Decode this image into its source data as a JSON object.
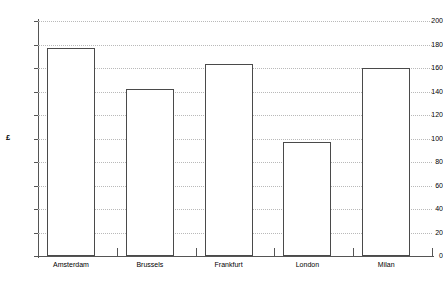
{
  "chart_data": {
    "type": "bar",
    "title": "",
    "xlabel": "",
    "ylabel": "£",
    "categories": [
      "Amsterdam",
      "Brussels",
      "Frankfurt",
      "London",
      "Milan"
    ],
    "values": [
      177,
      142,
      163,
      97,
      160
    ],
    "ylim": [
      0,
      200
    ],
    "ytick_labels": [
      "200",
      "180",
      "160",
      "140",
      "120",
      "100",
      "80",
      "60",
      "40",
      "20",
      "0"
    ],
    "ytick_values": [
      200,
      180,
      160,
      140,
      120,
      100,
      80,
      60,
      40,
      20,
      0
    ],
    "ytick_step": 20,
    "grid": true,
    "grid_style": "dotted",
    "legend": null,
    "colors": {
      "bar_fill": "#ffffff",
      "bar_outline": "#4a4a4a",
      "gridline": "#b9b9b9",
      "axis": "#555555",
      "text": "#000000",
      "background": "#ffffff"
    }
  }
}
